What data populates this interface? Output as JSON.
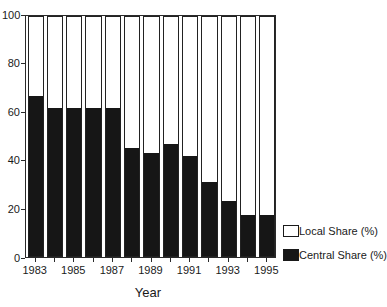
{
  "chart_data": {
    "type": "bar",
    "stacked": true,
    "title": "",
    "xlabel": "Year",
    "ylabel": "",
    "ylim": [
      0,
      100
    ],
    "yticks": [
      0,
      20,
      40,
      60,
      80,
      100
    ],
    "categories": [
      1983,
      1984,
      1985,
      1986,
      1987,
      1988,
      1989,
      1990,
      1991,
      1992,
      1993,
      1994,
      1995
    ],
    "xtick_labels_shown": [
      "1983",
      "1985",
      "1987",
      "1989",
      "1991",
      "1993",
      "1995"
    ],
    "series": [
      {
        "name": "Central Share (%)",
        "fill": "#161616",
        "values": [
          67,
          62,
          62,
          62,
          62,
          45,
          43,
          47,
          42,
          31,
          23,
          17,
          17
        ]
      },
      {
        "name": "Local Share (%)",
        "fill": "#ffffff",
        "values": [
          33,
          38,
          38,
          38,
          38,
          55,
          57,
          53,
          58,
          69,
          77,
          83,
          83
        ]
      }
    ],
    "legend": {
      "position": "right-bottom",
      "entries": [
        {
          "label": "Local Share (%)",
          "fill": "#ffffff"
        },
        {
          "label": "Central Share (%)",
          "fill": "#161616"
        }
      ]
    },
    "grid": false
  },
  "colors": {
    "foreground": "#1a1a1a",
    "background": "#ffffff"
  }
}
